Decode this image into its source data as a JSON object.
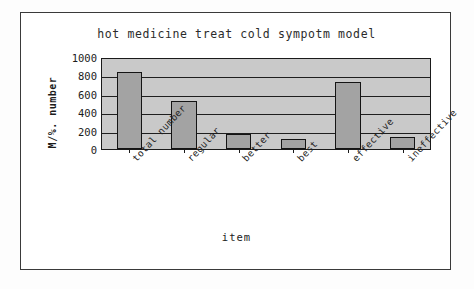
{
  "chart_data": {
    "type": "bar",
    "title": "hot medicine treat cold sympotm model",
    "xlabel": "item",
    "ylabel": "M/%. number",
    "categories": [
      "total number",
      "regular",
      "better",
      "best",
      "effective",
      "ineffective"
    ],
    "values": [
      840,
      520,
      165,
      110,
      730,
      130
    ],
    "ylim": [
      0,
      1000
    ],
    "yticks": [
      1000,
      800,
      600,
      400,
      200,
      0
    ],
    "ytick_labels": [
      "1000",
      "800",
      "600",
      "400",
      "200",
      "0"
    ],
    "grid": true,
    "legend": false,
    "legend_position": "none",
    "colors": {
      "bar_fill": "#a3a3a3",
      "bar_border": "#141414",
      "plot_background": "#c9c9c9",
      "axis": "#1a1a1a",
      "frame_border": "#3a3a3a",
      "page_background": "#ffffff",
      "text": "#1c1c1c"
    }
  }
}
